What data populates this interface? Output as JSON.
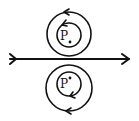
{
  "diagram": {
    "type": "magnetic-field-around-wire",
    "colors": {
      "ink": "#111111",
      "background": "#ffffff"
    },
    "wire": {
      "direction": "left-to-right",
      "y": 59,
      "x_start": 10,
      "x_end": 130
    },
    "loops": {
      "top": {
        "label": "P",
        "outer": {
          "cx": 69,
          "cy": 34,
          "r": 22,
          "arrow": "counterclockwise"
        },
        "inner": {
          "cx": 69,
          "cy": 35,
          "r": 12,
          "arrow": "counterclockwise"
        }
      },
      "bottom": {
        "label": "P",
        "outer": {
          "cx": 69,
          "cy": 88,
          "r": 23,
          "arrow": "clockwise"
        },
        "inner": {
          "cx": 69,
          "cy": 84,
          "r": 12,
          "arrow": "clockwise"
        }
      }
    }
  }
}
